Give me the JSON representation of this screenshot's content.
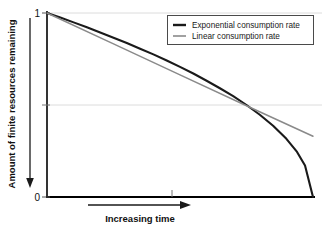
{
  "chart_data": {
    "type": "line",
    "title": "",
    "xlabel": "Increasing time",
    "ylabel": "Amount of finite resources remaining",
    "xlim": [
      0,
      1
    ],
    "ylim": [
      0,
      1
    ],
    "grid": true,
    "grid_values": [
      1,
      0.5
    ],
    "legend_position": "top-right",
    "x_tick_labels": [],
    "y_tick_labels": [
      "1",
      "0"
    ],
    "y_ticks": [
      1,
      0
    ],
    "x_axis_direction": "increasing",
    "y_axis_direction": "decreasing",
    "series": [
      {
        "name": "Exponential consumption rate",
        "color": "#1a1a1a",
        "width": 2.1,
        "x": [
          0.0,
          0.05,
          0.1,
          0.15,
          0.2,
          0.25,
          0.3,
          0.35,
          0.4,
          0.45,
          0.5,
          0.55,
          0.6,
          0.65,
          0.7,
          0.75,
          0.8,
          0.85,
          0.9,
          0.94,
          0.97,
          1.0
        ],
        "values": [
          1.0,
          0.975,
          0.949,
          0.922,
          0.894,
          0.866,
          0.837,
          0.806,
          0.775,
          0.742,
          0.707,
          0.671,
          0.632,
          0.591,
          0.548,
          0.5,
          0.447,
          0.387,
          0.316,
          0.245,
          0.171,
          0.0
        ]
      },
      {
        "name": "Linear consumption rate",
        "color": "#8a8a8a",
        "width": 1.5,
        "x": [
          0.0,
          0.25,
          0.5,
          0.75,
          1.0
        ],
        "values": [
          1.0,
          0.832,
          0.664,
          0.496,
          0.33
        ]
      }
    ]
  },
  "legend": {
    "items": [
      {
        "label": "Exponential consumption rate",
        "color": "#1a1a1a",
        "width": 2.4
      },
      {
        "label": "Linear consumption rate",
        "color": "#8a8a8a",
        "width": 1.6
      }
    ]
  },
  "axes": {
    "y_label": "Amount of finite resources remaining",
    "y_top_tick": "1",
    "y_bottom_tick": "0",
    "x_label": "Increasing time"
  },
  "colors": {
    "exponential": "#1a1a1a",
    "linear": "#8a8a8a",
    "axis": "#000000",
    "gridline": "#d8d8d8",
    "background": "#ffffff"
  }
}
